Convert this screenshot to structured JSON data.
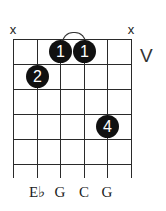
{
  "diagram": {
    "type": "guitar-chord-diagram",
    "position_marker": "V",
    "strings": [
      {
        "index": 1,
        "state": "muted",
        "marker": "x",
        "note": ""
      },
      {
        "index": 2,
        "state": "fretted",
        "fret": 2,
        "finger": "2",
        "note": "E♭"
      },
      {
        "index": 3,
        "state": "fretted",
        "fret": 1,
        "finger": "1",
        "note": "G"
      },
      {
        "index": 4,
        "state": "fretted",
        "fret": 1,
        "finger": "1",
        "note": "C"
      },
      {
        "index": 5,
        "state": "fretted",
        "fret": 4,
        "finger": "4",
        "note": "G"
      },
      {
        "index": 6,
        "state": "muted",
        "marker": "x",
        "note": ""
      }
    ],
    "barre": {
      "fret": 1,
      "from_string": 3,
      "to_string": 4
    },
    "frets_shown": 5,
    "labels": {
      "mute_left": "x",
      "mute_right": "x",
      "finger_1a": "1",
      "finger_1b": "1",
      "finger_2": "2",
      "finger_4": "4",
      "note_2": "E♭",
      "note_3": "G",
      "note_4": "C",
      "note_5": "G"
    },
    "colors": {
      "dot": "#111111",
      "line": "#2a2a2a",
      "background": "#ffffff"
    }
  }
}
